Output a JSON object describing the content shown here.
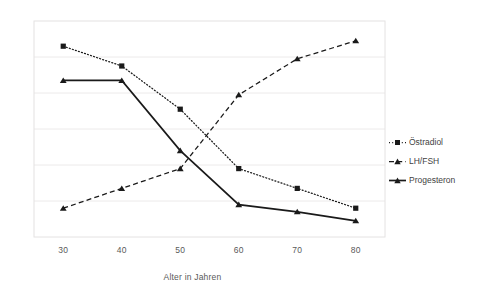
{
  "chart_data": {
    "type": "line",
    "title": "",
    "xlabel": "Alter in Jahren",
    "ylabel": "",
    "categories": [
      30,
      40,
      50,
      60,
      70,
      80
    ],
    "x_tick_labels": [
      "30",
      "40",
      "50",
      "60",
      "70",
      "80"
    ],
    "y_tick_labels": [],
    "ylim": [
      0,
      6
    ],
    "grid": true,
    "grid_lines": 5,
    "legend_position": "right",
    "series": [
      {
        "name": "Östradiol",
        "marker": "square",
        "line_style": "dotted",
        "color": "#1a1a1a",
        "values": [
          5.3,
          4.75,
          3.55,
          1.9,
          1.35,
          0.8
        ]
      },
      {
        "name": "LH/FSH",
        "marker": "triangle",
        "line_style": "dashed",
        "color": "#1a1a1a",
        "values": [
          0.8,
          1.35,
          1.9,
          3.95,
          4.95,
          5.45
        ]
      },
      {
        "name": "Progesteron",
        "marker": "triangle",
        "line_style": "solid",
        "color": "#1a1a1a",
        "values": [
          4.35,
          4.35,
          2.4,
          0.9,
          0.7,
          0.45
        ]
      }
    ]
  },
  "axis": {
    "x_title": "Alter in Jahren"
  },
  "legend": {
    "items": [
      {
        "label": "Östradiol"
      },
      {
        "label": "LH/FSH"
      },
      {
        "label": "Progesteron"
      }
    ]
  },
  "colors": {
    "series": "#1a1a1a",
    "grid": "#eceaea",
    "frame": "#e4e2e2",
    "text": "#595959"
  }
}
